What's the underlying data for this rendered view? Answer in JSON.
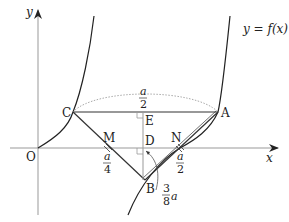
{
  "figure": {
    "function_label": "y = f(x)",
    "axes": {
      "x_label": "x",
      "y_label": "y",
      "origin_label": "O"
    },
    "points": {
      "A": "A",
      "B": "B",
      "C": "C",
      "D": "D",
      "E": "E",
      "M": "M",
      "N": "N"
    },
    "measurements": {
      "CA_arc": {
        "num": "a",
        "den": "2"
      },
      "OM": {
        "num": "a",
        "den": "4"
      },
      "DN": {
        "num": "a",
        "den": "2"
      },
      "DB": {
        "num": "3",
        "den": "8",
        "suffix": "a"
      }
    },
    "colors": {
      "axis": "#999999",
      "curve": "#222222",
      "segment": "#333333",
      "dotted": "#aaaaaa"
    }
  }
}
